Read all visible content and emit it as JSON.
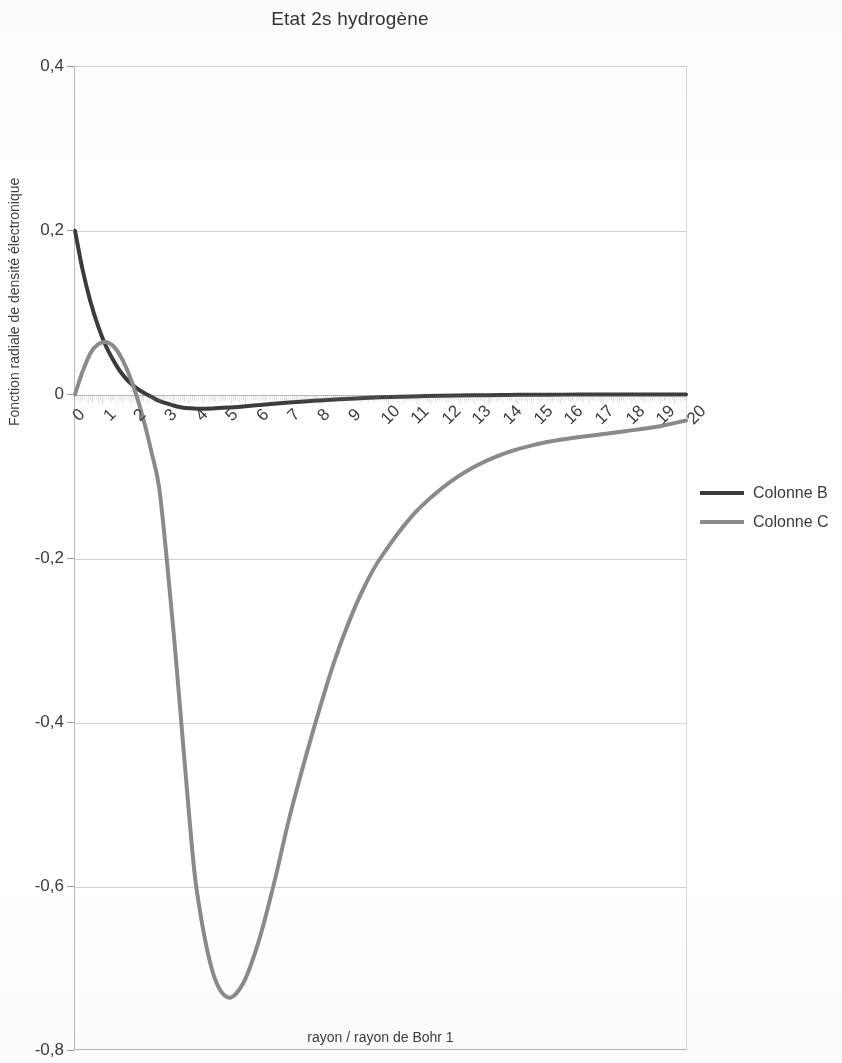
{
  "chart_data": {
    "type": "line",
    "title": "Etat 2s hydrogène",
    "xlabel": "rayon / rayon de Bohr 1",
    "ylabel": "Fonction radiale de densité électronique",
    "xlim": [
      0,
      20
    ],
    "ylim": [
      -0.8,
      0.4
    ],
    "grid": true,
    "legend_position": "right",
    "x_tick_labels": [
      "0",
      "1",
      "2",
      "3",
      "4",
      "5",
      "6",
      "7",
      "8",
      "9",
      "10",
      "11",
      "12",
      "13",
      "14",
      "15",
      "16",
      "17",
      "18",
      "19",
      "20"
    ],
    "y_tick_labels": [
      "0,4",
      "0,2",
      "0",
      "-0,2",
      "-0,4",
      "-0,6",
      "-0,8"
    ],
    "y_tick_values": [
      0.4,
      0.2,
      0,
      -0.2,
      -0.4,
      -0.6,
      -0.8
    ],
    "x": [
      0,
      0.25,
      0.5,
      0.75,
      1,
      1.25,
      1.5,
      1.75,
      2,
      2.25,
      2.5,
      2.75,
      3,
      3.25,
      3.5,
      3.75,
      4,
      4.5,
      5,
      5.5,
      6,
      6.5,
      7,
      7.5,
      8,
      8.5,
      9,
      9.5,
      10,
      11,
      12,
      13,
      14,
      15,
      16,
      17,
      18,
      19,
      20
    ],
    "series": [
      {
        "name": "Colonne B",
        "color": "#3b3b3b",
        "width": 4,
        "values": [
          0.2,
          0.152,
          0.114,
          0.084,
          0.06,
          0.042,
          0.027,
          0.016,
          0.008,
          0.002,
          -0.003,
          -0.008,
          -0.011,
          -0.014,
          -0.016,
          -0.017,
          -0.0175,
          -0.0172,
          -0.0162,
          -0.0148,
          -0.0132,
          -0.0116,
          -0.0101,
          -0.0087,
          -0.0074,
          -0.0063,
          -0.0053,
          -0.0044,
          -0.0037,
          -0.0026,
          -0.0018,
          -0.0012,
          -0.0008,
          -0.0005,
          -0.00035,
          -0.00022,
          -0.00014,
          -9e-05,
          -6e-05
        ]
      },
      {
        "name": "Colonne C",
        "color": "#8a8a8a",
        "width": 4,
        "values": [
          0,
          0.028,
          0.05,
          0.061,
          0.064,
          0.059,
          0.046,
          0.026,
          0,
          -0.032,
          -0.07,
          -0.113,
          -0.2,
          -0.3,
          -0.41,
          -0.52,
          -0.61,
          -0.705,
          -0.737,
          -0.72,
          -0.67,
          -0.6,
          -0.52,
          -0.45,
          -0.385,
          -0.325,
          -0.275,
          -0.233,
          -0.2,
          -0.15,
          -0.115,
          -0.09,
          -0.073,
          -0.062,
          -0.055,
          -0.05,
          -0.045,
          -0.04,
          -0.032
        ]
      }
    ]
  },
  "legend": {
    "items": [
      {
        "label": "Colonne B",
        "color": "#3b3b3b"
      },
      {
        "label": "Colonne C",
        "color": "#8a8a8a"
      }
    ]
  }
}
